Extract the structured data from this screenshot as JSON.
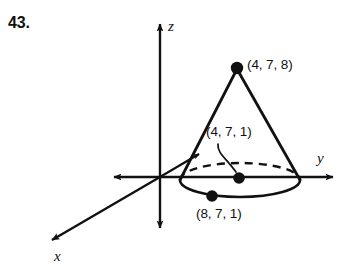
{
  "problem": {
    "number": "43."
  },
  "figure": {
    "type": "3d-cone-diagram",
    "stroke_color": "#111111",
    "background_color": "#ffffff",
    "axes": [
      {
        "name": "z",
        "label": "z",
        "direction": "vertical",
        "arrows": "both"
      },
      {
        "name": "y",
        "label": "y",
        "direction": "horizontal",
        "arrows": "both"
      },
      {
        "name": "x",
        "label": "x",
        "direction": "diagonal-down-left",
        "arrows": "both"
      }
    ],
    "points": [
      {
        "name": "apex",
        "label": "(4, 7, 8)",
        "coords": [
          4,
          7,
          8
        ]
      },
      {
        "name": "base-center",
        "label": "(4, 7, 1)",
        "coords": [
          4,
          7,
          1
        ]
      },
      {
        "name": "base-rim",
        "label": "(8, 7, 1)",
        "coords": [
          8,
          7,
          1
        ]
      }
    ],
    "base": {
      "shape": "ellipse",
      "hidden_half": "dashed",
      "visible_half": "solid"
    }
  }
}
